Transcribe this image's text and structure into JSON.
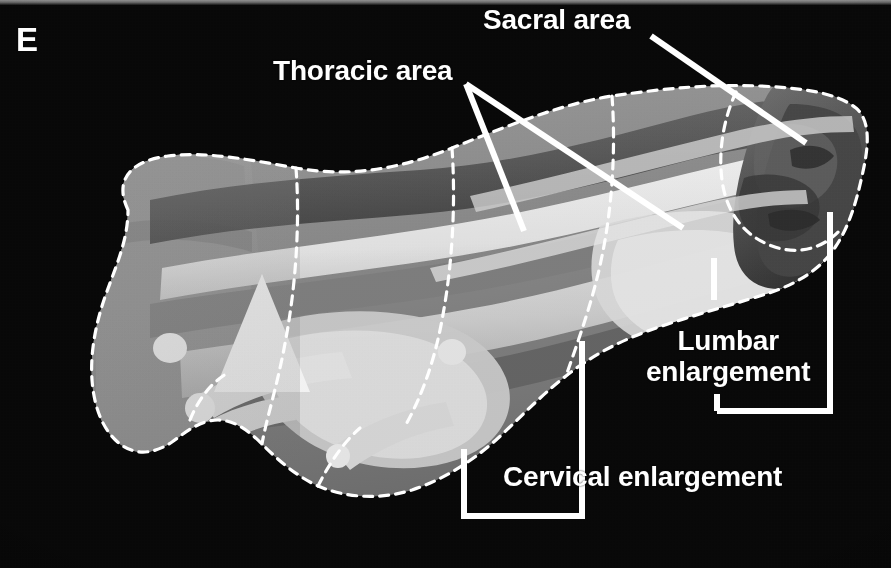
{
  "figure": {
    "panel_letter": "E",
    "background_color": "#050505",
    "annotation_color": "#ffffff",
    "outline_style": "white-dashed",
    "modality": "3d-reconstruction-grayscale"
  },
  "annotations": {
    "sacral": {
      "label": "Sacral area",
      "kind": "leader-line",
      "leaders": [
        {
          "x1": 651,
          "y1": 36,
          "x2": 806,
          "y2": 143
        }
      ]
    },
    "thoracic": {
      "label": "Thoracic area",
      "kind": "leader-line",
      "leaders": [
        {
          "x1": 466,
          "y1": 84,
          "x2": 524,
          "y2": 231
        },
        {
          "x1": 466,
          "y1": 84,
          "x2": 683,
          "y2": 228
        }
      ]
    },
    "lumbar": {
      "label_line1": "Lumbar",
      "label_line2": "enlargement",
      "label": "Lumbar enlargement",
      "kind": "bracket",
      "bracket": {
        "left_tick_x": 714,
        "left_tick_y1": 258,
        "left_tick_y2": 300,
        "right_x": 830,
        "right_y1": 212,
        "right_y2": 411,
        "bottom_y": 411,
        "bottom_x1": 717,
        "bottom_x2": 830,
        "stub_x": 717,
        "stub_y1": 396,
        "stub_y2": 411
      }
    },
    "cervical": {
      "label": "Cervical enlargement",
      "kind": "bracket",
      "bracket": {
        "right_x": 582,
        "right_y1": 341,
        "right_y2": 516,
        "left_x": 464,
        "left_y1": 449,
        "left_y2": 516,
        "bottom_y": 516,
        "bottom_x1": 464,
        "bottom_x2": 582
      }
    }
  },
  "specimen": {
    "outline_label": "dashed-outline",
    "regions": [
      {
        "name": "rostral-block",
        "tone": "#8d8d8d"
      },
      {
        "name": "cervical-enlargement",
        "tone": "#b5b5b5"
      },
      {
        "name": "thoracic-area",
        "tone": "#7e7e7e"
      },
      {
        "name": "lumbar-enlargement",
        "tone": "#d8d8d8"
      },
      {
        "name": "sacral-area",
        "tone": "#4a4a4a"
      },
      {
        "name": "white-matter-tract",
        "tone": "#f2f2f2"
      },
      {
        "name": "marker-cone",
        "tone": "#ffffff"
      }
    ]
  }
}
